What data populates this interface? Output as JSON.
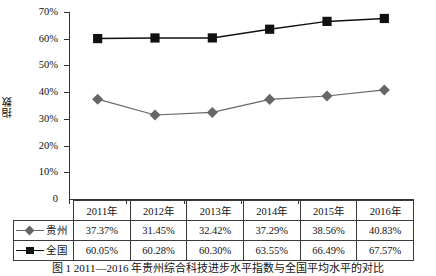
{
  "chart_data": {
    "type": "line",
    "title": "",
    "xlabel": "",
    "ylabel": "指数",
    "categories": [
      "2011年",
      "2012年",
      "2013年",
      "2014年",
      "2015年",
      "2016年"
    ],
    "ylim": [
      0,
      70
    ],
    "ytick_labels": [
      "0",
      "10%",
      "20%",
      "30%",
      "40%",
      "50%",
      "60%",
      "70%"
    ],
    "ytick_values": [
      0,
      10,
      20,
      30,
      40,
      50,
      60,
      70
    ],
    "grid": false,
    "legend_position": "table-left-column",
    "series": [
      {
        "name": "贵州",
        "marker": "diamond",
        "color": "#666666",
        "values": [
          37.37,
          31.45,
          32.42,
          37.29,
          38.56,
          40.83
        ],
        "labels": [
          "37.37%",
          "31.45%",
          "32.42%",
          "37.29%",
          "38.56%",
          "40.83%"
        ]
      },
      {
        "name": "全国",
        "marker": "square",
        "color": "#111111",
        "values": [
          60.05,
          60.28,
          60.3,
          63.55,
          66.49,
          67.57
        ],
        "labels": [
          "60.05%",
          "60.28%",
          "60.30%",
          "63.55%",
          "66.49%",
          "67.57%"
        ]
      }
    ]
  },
  "caption": "图 1  2011—2016 年贵州综合科技进步水平指数与全国平均水平的对比"
}
